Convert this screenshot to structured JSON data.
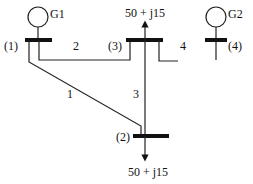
{
  "diagram": {
    "type": "power-system one-line diagram",
    "generators": [
      {
        "id": "G1",
        "label": "G1",
        "bus": 1
      },
      {
        "id": "G2",
        "label": "G2",
        "bus": 4
      }
    ],
    "buses": [
      {
        "id": 1,
        "label": "(1)"
      },
      {
        "id": 2,
        "label": "(2)"
      },
      {
        "id": 3,
        "label": "(3)"
      },
      {
        "id": 4,
        "label": "(4)"
      }
    ],
    "lines": [
      {
        "id": 1,
        "label": "1",
        "from": 1,
        "to": 2
      },
      {
        "id": 2,
        "label": "2",
        "from": 1,
        "to": 3
      },
      {
        "id": 3,
        "label": "3",
        "from": 3,
        "to": 2
      },
      {
        "id": 4,
        "label": "4",
        "from": 3,
        "to": 4
      }
    ],
    "loads": [
      {
        "bus": 3,
        "label": "50 + j15",
        "direction": "up"
      },
      {
        "bus": 2,
        "label": "50 + j15",
        "direction": "down"
      }
    ]
  }
}
